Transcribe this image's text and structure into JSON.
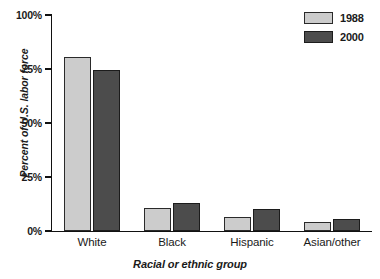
{
  "chart_data": {
    "type": "bar",
    "title": "",
    "xlabel": "Racial or ethnic group",
    "ylabel": "Percent of U.S. labor force",
    "categories": [
      "White",
      "Black",
      "Hispanic",
      "Asian/other"
    ],
    "series": [
      {
        "name": "1988",
        "color": "#cccccc",
        "values": [
          80.5,
          10.5,
          6.5,
          4.0
        ]
      },
      {
        "name": "2000",
        "color": "#4c4c4c",
        "values": [
          74.5,
          13.0,
          10.0,
          5.5
        ]
      }
    ],
    "ylim": [
      0,
      100
    ],
    "yticks": [
      0,
      25,
      50,
      75,
      100
    ],
    "ytick_labels": [
      "0%",
      "25%",
      "50%",
      "75%",
      "100%"
    ],
    "grid": false,
    "legend_position": "top-right"
  },
  "axes": {
    "y_title": "Percent of U.S. labor force",
    "x_title": "Racial or ethnic group"
  },
  "legend": {
    "items": [
      {
        "label": "1988"
      },
      {
        "label": "2000"
      }
    ]
  }
}
